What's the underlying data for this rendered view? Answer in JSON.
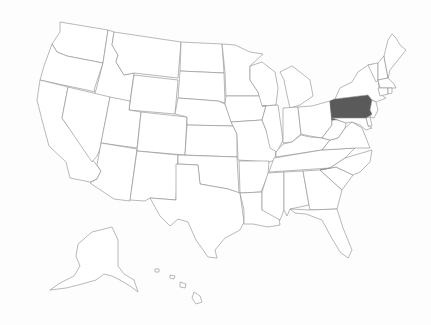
{
  "map": {
    "title": "",
    "region": "United States",
    "highlighted_states": [
      "Pennsylvania"
    ],
    "colors": {
      "background": "#fdfdfd",
      "state_fill": "#ffffff",
      "state_stroke": "#8a8a8a",
      "highlight_fill": "#5a5a5a"
    },
    "states": [
      {
        "id": "WA",
        "name": "Washington",
        "highlight": false
      },
      {
        "id": "OR",
        "name": "Oregon",
        "highlight": false
      },
      {
        "id": "CA",
        "name": "California",
        "highlight": false
      },
      {
        "id": "ID",
        "name": "Idaho",
        "highlight": false
      },
      {
        "id": "NV",
        "name": "Nevada",
        "highlight": false
      },
      {
        "id": "MT",
        "name": "Montana",
        "highlight": false
      },
      {
        "id": "WY",
        "name": "Wyoming",
        "highlight": false
      },
      {
        "id": "UT",
        "name": "Utah",
        "highlight": false
      },
      {
        "id": "AZ",
        "name": "Arizona",
        "highlight": false
      },
      {
        "id": "CO",
        "name": "Colorado",
        "highlight": false
      },
      {
        "id": "NM",
        "name": "New Mexico",
        "highlight": false
      },
      {
        "id": "ND",
        "name": "North Dakota",
        "highlight": false
      },
      {
        "id": "SD",
        "name": "South Dakota",
        "highlight": false
      },
      {
        "id": "NE",
        "name": "Nebraska",
        "highlight": false
      },
      {
        "id": "KS",
        "name": "Kansas",
        "highlight": false
      },
      {
        "id": "OK",
        "name": "Oklahoma",
        "highlight": false
      },
      {
        "id": "TX",
        "name": "Texas",
        "highlight": false
      },
      {
        "id": "MN",
        "name": "Minnesota",
        "highlight": false
      },
      {
        "id": "IA",
        "name": "Iowa",
        "highlight": false
      },
      {
        "id": "MO",
        "name": "Missouri",
        "highlight": false
      },
      {
        "id": "AR",
        "name": "Arkansas",
        "highlight": false
      },
      {
        "id": "LA",
        "name": "Louisiana",
        "highlight": false
      },
      {
        "id": "WI",
        "name": "Wisconsin",
        "highlight": false
      },
      {
        "id": "IL",
        "name": "Illinois",
        "highlight": false
      },
      {
        "id": "MI",
        "name": "Michigan",
        "highlight": false
      },
      {
        "id": "IN",
        "name": "Indiana",
        "highlight": false
      },
      {
        "id": "OH",
        "name": "Ohio",
        "highlight": false
      },
      {
        "id": "KY",
        "name": "Kentucky",
        "highlight": false
      },
      {
        "id": "TN",
        "name": "Tennessee",
        "highlight": false
      },
      {
        "id": "MS",
        "name": "Mississippi",
        "highlight": false
      },
      {
        "id": "AL",
        "name": "Alabama",
        "highlight": false
      },
      {
        "id": "GA",
        "name": "Georgia",
        "highlight": false
      },
      {
        "id": "FL",
        "name": "Florida",
        "highlight": false
      },
      {
        "id": "SC",
        "name": "South Carolina",
        "highlight": false
      },
      {
        "id": "NC",
        "name": "North Carolina",
        "highlight": false
      },
      {
        "id": "VA",
        "name": "Virginia",
        "highlight": false
      },
      {
        "id": "WV",
        "name": "West Virginia",
        "highlight": false
      },
      {
        "id": "PA",
        "name": "Pennsylvania",
        "highlight": true
      },
      {
        "id": "NY",
        "name": "New York",
        "highlight": false
      },
      {
        "id": "NJ",
        "name": "New Jersey",
        "highlight": false
      },
      {
        "id": "DE",
        "name": "Delaware",
        "highlight": false
      },
      {
        "id": "MD",
        "name": "Maryland",
        "highlight": false
      },
      {
        "id": "VT",
        "name": "Vermont",
        "highlight": false
      },
      {
        "id": "NH",
        "name": "New Hampshire",
        "highlight": false
      },
      {
        "id": "ME",
        "name": "Maine",
        "highlight": false
      },
      {
        "id": "MA",
        "name": "Massachusetts",
        "highlight": false
      },
      {
        "id": "CT",
        "name": "Connecticut",
        "highlight": false
      },
      {
        "id": "RI",
        "name": "Rhode Island",
        "highlight": false
      },
      {
        "id": "AK",
        "name": "Alaska",
        "highlight": false
      },
      {
        "id": "HI",
        "name": "Hawaii",
        "highlight": false
      }
    ]
  }
}
